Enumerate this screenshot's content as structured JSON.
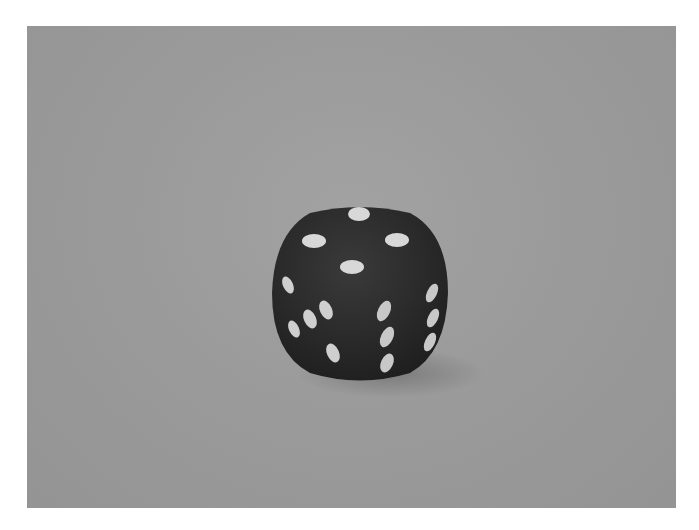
{
  "image": {
    "subject": "six-sided die",
    "die_color": "#2b2b2b",
    "pip_color": "#d8d8d8",
    "background_color": "#9a9a9a",
    "visible_faces": {
      "top": 4,
      "left": 5,
      "right": 6
    }
  }
}
